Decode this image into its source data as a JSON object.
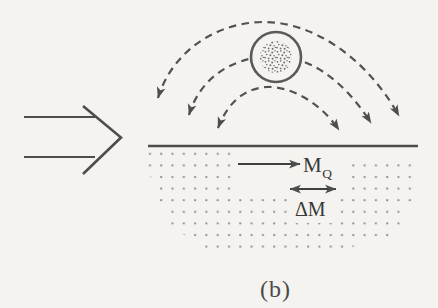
{
  "diagram": {
    "caption": "(b)",
    "labels": {
      "flux_main": "M",
      "flux_sub": "Q",
      "delta": "ΔM"
    },
    "colors": {
      "paper": "#f4f3ef",
      "ink": "#4d4d4d",
      "dashed_streamlines": "#525252",
      "region_dots": "#909090",
      "circle_speckle": "#6e6e6e",
      "label_text": "#383838"
    }
  }
}
